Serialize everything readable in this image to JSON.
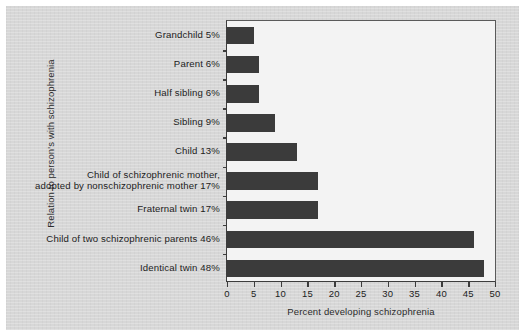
{
  "chart_data": {
    "type": "bar",
    "orientation": "horizontal",
    "title": "",
    "xlabel": "Percent developing schizophrenia",
    "ylabel": "Relation to person's with schizophrenia",
    "xlim": [
      0,
      50
    ],
    "xticks": [
      0,
      5,
      10,
      15,
      20,
      25,
      30,
      35,
      40,
      45,
      50
    ],
    "grid": false,
    "legend": null,
    "bar_color": "#3b3b3b",
    "plot_background": "#f3f3f3",
    "figure_background": "#d7d7d7",
    "categories": [
      "Grandchild",
      "Parent",
      "Half sibling",
      "Sibling",
      "Child",
      "Child of schizophrenic mother, adopted by nonschizophrenic mother",
      "Fraternal twin",
      "Child of two schizophrenic parents",
      "Identical twin"
    ],
    "category_labels": [
      [
        "Grandchild 5%"
      ],
      [
        "Parent 6%"
      ],
      [
        "Half sibling 6%"
      ],
      [
        "Sibling 9%"
      ],
      [
        "Child 13%"
      ],
      [
        "Child of schizophrenic mother,",
        "adopted by nonschizophrenic mother 17%"
      ],
      [
        "Fraternal twin 17%"
      ],
      [
        "Child of two schizophrenic parents 46%"
      ],
      [
        "Identical twin 48%"
      ]
    ],
    "values": [
      5,
      6,
      6,
      9,
      13,
      17,
      17,
      46,
      48
    ],
    "value_labels": [
      "5%",
      "6%",
      "6%",
      "9%",
      "13%",
      "17%",
      "17%",
      "46%",
      "48%"
    ]
  }
}
